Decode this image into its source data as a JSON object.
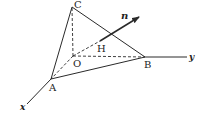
{
  "diagram": {
    "type": "3d-coordinate-tetrahedron",
    "points": {
      "O": {
        "label": "O",
        "x": 73,
        "y": 56
      },
      "A": {
        "label": "A",
        "x": 51,
        "y": 79
      },
      "B": {
        "label": "B",
        "x": 145,
        "y": 57
      },
      "C": {
        "label": "C",
        "x": 72,
        "y": 6
      },
      "H": {
        "label": "H",
        "x": 100,
        "y": 41
      }
    },
    "axes": {
      "x": {
        "label": "x"
      },
      "y": {
        "label": "y"
      }
    },
    "vector": {
      "label": "n"
    },
    "colors": {
      "stroke": "#2a2a2a",
      "background": "#ffffff"
    }
  }
}
